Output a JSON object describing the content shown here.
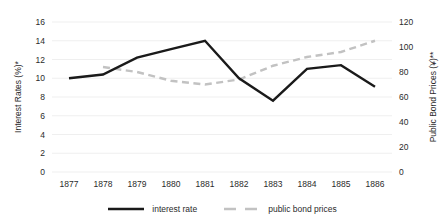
{
  "chart_data": {
    "type": "line",
    "title": "",
    "xlabel": "",
    "categories": [
      "1877",
      "1878",
      "1879",
      "1880",
      "1881",
      "1882",
      "1883",
      "1884",
      "1885",
      "1886"
    ],
    "grid": true,
    "legend_position": "bottom",
    "axes": {
      "left": {
        "label": "Interest Rates (%)*",
        "ticks": [
          0,
          2,
          4,
          6,
          8,
          10,
          12,
          14,
          16
        ],
        "ylim": [
          0,
          16
        ]
      },
      "right": {
        "label": "Public Bond Prices (¥)**",
        "ticks": [
          0,
          20,
          40,
          60,
          80,
          100,
          120
        ],
        "ylim": [
          0,
          120
        ]
      }
    },
    "series": [
      {
        "name": "interest rate",
        "axis": "left",
        "style": "solid",
        "color": "#1a1a1a",
        "x": [
          "1877",
          "1878",
          "1879",
          "1880",
          "1881",
          "1882",
          "1883",
          "1884",
          "1885",
          "1886"
        ],
        "values": [
          10.0,
          10.4,
          12.2,
          13.1,
          14.0,
          10.0,
          7.6,
          11.0,
          11.4,
          9.1
        ]
      },
      {
        "name": "public bond prices",
        "axis": "right",
        "style": "dashed",
        "color": "#c2c2c2",
        "x": [
          "1878",
          "1879",
          "1880",
          "1881",
          "1882",
          "1883",
          "1884",
          "1885",
          "1886"
        ],
        "values": [
          84,
          80,
          73,
          70,
          74,
          85,
          92,
          96,
          105
        ]
      }
    ]
  },
  "legend": {
    "items": [
      {
        "label": "interest rate"
      },
      {
        "label": "public bond prices"
      }
    ]
  }
}
